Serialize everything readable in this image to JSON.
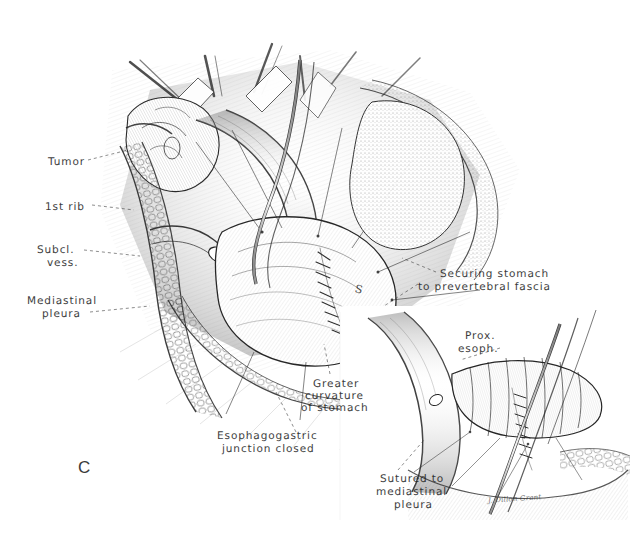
{
  "figure": {
    "panel_letter": "C",
    "signature": "J. Dillon Grant",
    "background_color": "#ffffff",
    "ink_color": "#1d1d1d",
    "medium": "pen-and-ink stipple / hatch surgical illustration",
    "width": 632,
    "height": 546
  },
  "labels": [
    {
      "id": "tumor",
      "text": "Tumor",
      "x": 48,
      "y": 156,
      "align": "left"
    },
    {
      "id": "first-rib",
      "text": "1st rib",
      "x": 45,
      "y": 201,
      "align": "left"
    },
    {
      "id": "subclavian-1",
      "text": "Subcl.",
      "x": 37,
      "y": 244,
      "align": "left"
    },
    {
      "id": "subclavian-2",
      "text": "vess.",
      "x": 47,
      "y": 257,
      "align": "left"
    },
    {
      "id": "mediastinal-1",
      "text": "Mediastinal",
      "x": 27,
      "y": 295,
      "align": "left"
    },
    {
      "id": "mediastinal-2",
      "text": "pleura",
      "x": 42,
      "y": 308,
      "align": "left"
    },
    {
      "id": "securing-1",
      "text": "Securing stomach",
      "x": 440,
      "y": 268,
      "align": "left"
    },
    {
      "id": "securing-2",
      "text": "to prevertebral fascia",
      "x": 418,
      "y": 281,
      "align": "left"
    },
    {
      "id": "prox-esoph-1",
      "text": "Prox.",
      "x": 465,
      "y": 330,
      "align": "left"
    },
    {
      "id": "prox-esoph-2",
      "text": "esoph.",
      "x": 458,
      "y": 343,
      "align": "left"
    },
    {
      "id": "greater-curv-1",
      "text": "Greater",
      "x": 313,
      "y": 378,
      "align": "left"
    },
    {
      "id": "greater-curv-2",
      "text": "curvature",
      "x": 305,
      "y": 390,
      "align": "left"
    },
    {
      "id": "greater-curv-3",
      "text": "of stomach",
      "x": 301,
      "y": 402,
      "align": "left"
    },
    {
      "id": "egj-1",
      "text": "Esophagogastric",
      "x": 217,
      "y": 430,
      "align": "left"
    },
    {
      "id": "egj-2",
      "text": "junction closed",
      "x": 222,
      "y": 443,
      "align": "left"
    },
    {
      "id": "sutured-1",
      "text": "Sutured to",
      "x": 380,
      "y": 473,
      "align": "left"
    },
    {
      "id": "sutured-2",
      "text": "mediastinal",
      "x": 376,
      "y": 486,
      "align": "left"
    },
    {
      "id": "sutured-3",
      "text": "pleura",
      "x": 394,
      "y": 499,
      "align": "left"
    }
  ],
  "tissue_marks": [
    {
      "id": "stomach-s-mark",
      "text": "S",
      "x": 355,
      "y": 283
    }
  ],
  "panel_letter_pos": {
    "x": 78,
    "y": 458
  },
  "signature_pos": {
    "x": 488,
    "y": 495
  }
}
